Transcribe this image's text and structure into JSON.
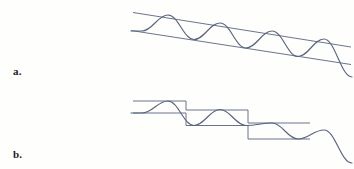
{
  "figure": {
    "background_color": "#fefefd",
    "stroke_color": "#5a6480",
    "label_color": "#1d1d1d",
    "width": 354,
    "height": 169
  },
  "panels": [
    {
      "key": "a",
      "label": "a.",
      "label_x": 13,
      "label_y": 66,
      "envelope_type": "linear",
      "description": "Sinusoid bounded by two parallel descending straight lines"
    },
    {
      "key": "b",
      "label": "b.",
      "label_x": 13,
      "label_y": 149,
      "envelope_type": "staircase",
      "description": "Sinusoid bounded by a descending staircase envelope of three steps"
    }
  ],
  "chart_data": [
    {
      "type": "line",
      "panel": "a",
      "title": "",
      "xlabel": "",
      "ylabel": "",
      "grid": false,
      "legend": "none",
      "xlim": [
        133,
        352
      ],
      "ylim": [
        8,
        82
      ],
      "series": [
        {
          "name": "upper-envelope",
          "role": "envelope",
          "points": [
            [
              133,
              12.5
            ],
            [
              351,
              47.0
            ]
          ]
        },
        {
          "name": "lower-envelope",
          "role": "envelope",
          "points": [
            [
              131,
              30.5
            ],
            [
              351,
              64.5
            ]
          ]
        },
        {
          "name": "oscillation",
          "role": "wave",
          "period": 52,
          "peaks": [
            [
              168,
              15.0
            ],
            [
              220,
              23.0
            ],
            [
              272,
              31.0
            ],
            [
              324,
              39.0
            ]
          ],
          "troughs": [
            [
              142,
              31.0
            ],
            [
              194,
              39.5
            ],
            [
              246,
              48.0
            ],
            [
              298,
              56.5
            ]
          ],
          "start": [
            131,
            31.0
          ],
          "end": [
            352,
            77.0
          ]
        }
      ]
    },
    {
      "type": "line",
      "panel": "b",
      "title": "",
      "xlabel": "",
      "ylabel": "",
      "grid": false,
      "legend": "none",
      "xlim": [
        133,
        352
      ],
      "ylim": [
        96,
        166
      ],
      "steps": [
        {
          "index": 1,
          "x_start": 133,
          "x_end": 186,
          "y_top": 101.0,
          "y_bottom": 113.0
        },
        {
          "index": 2,
          "x_start": 186,
          "x_end": 248,
          "y_top": 110.0,
          "y_bottom": 125.5
        },
        {
          "index": 3,
          "x_start": 248,
          "x_end": 310,
          "y_top": 123.0,
          "y_bottom": 139.0
        }
      ],
      "series": [
        {
          "name": "oscillation",
          "role": "wave",
          "period": 52,
          "peaks": [
            [
              168,
              101.0
            ],
            [
              220,
              109.5
            ],
            [
              272,
              123.0
            ],
            [
              324,
              130.0
            ]
          ],
          "troughs": [
            [
              142,
              113.0
            ],
            [
              194,
              125.5
            ],
            [
              246,
              125.5
            ],
            [
              298,
              139.0
            ]
          ],
          "start": [
            131,
            113.0
          ],
          "end": [
            352,
            163.0
          ]
        }
      ]
    }
  ]
}
